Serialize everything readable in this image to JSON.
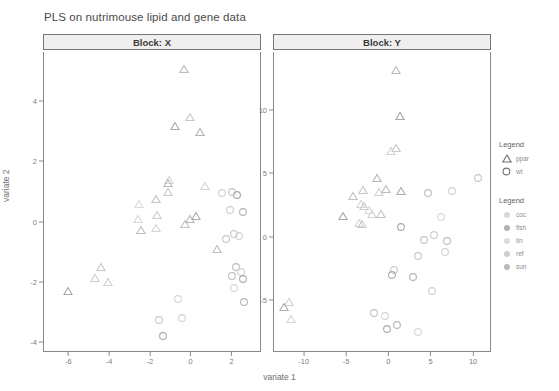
{
  "title": "PLS on nutrimouse lipid and gene data",
  "axis_labels": {
    "x": "variate 1",
    "y": "variate 2"
  },
  "legends": [
    {
      "title": "Legend",
      "name": "genotype-legend",
      "items": [
        {
          "label": "ppar",
          "shape": "triangle",
          "color": "#8d8d8d"
        },
        {
          "label": "wt",
          "shape": "circle",
          "color": "#8d8d8d"
        }
      ]
    },
    {
      "title": "Legend",
      "name": "diet-legend",
      "items": [
        {
          "label": "coc",
          "color": "#d8d8d8"
        },
        {
          "label": "fish",
          "color": "#b0b0b0"
        },
        {
          "label": "lin",
          "color": "#dcdcdc"
        },
        {
          "label": "ref",
          "color": "#cfcfcf"
        },
        {
          "label": "sun",
          "color": "#b8b8b8"
        }
      ]
    }
  ],
  "chart_data": {
    "type": "scatter",
    "title": "PLS on nutrimouse lipid and gene data",
    "xlabel": "variate 1",
    "ylabel": "variate 2",
    "grid": false,
    "legend_position": "right",
    "panels": [
      {
        "name": "Block: X",
        "xlim": [
          -7.2,
          3.4
        ],
        "ylim": [
          -4.3,
          5.6
        ],
        "xticks": [
          -6,
          -4,
          -2,
          0,
          2
        ],
        "yticks": [
          -4,
          -2,
          0,
          2,
          4
        ],
        "points": [
          {
            "x": -0.35,
            "y": 5.05,
            "group": "ppar",
            "diet": "lin",
            "color": "#b9b9b9"
          },
          {
            "x": -0.75,
            "y": 3.15,
            "group": "ppar",
            "diet": "fish",
            "color": "#a8a8a8"
          },
          {
            "x": -0.05,
            "y": 3.45,
            "group": "ppar",
            "diet": "coc",
            "color": "#c9c9c9"
          },
          {
            "x": 0.45,
            "y": 2.95,
            "group": "ppar",
            "diet": "sun",
            "color": "#b2b2b2"
          },
          {
            "x": -1.05,
            "y": 1.35,
            "group": "ppar",
            "diet": "ref",
            "color": "#d2d2d2"
          },
          {
            "x": -2.55,
            "y": 0.55,
            "group": "ppar",
            "diet": "coc",
            "color": "#dadada"
          },
          {
            "x": -2.6,
            "y": 0.05,
            "group": "ppar",
            "diet": "lin",
            "color": "#d6d6d6"
          },
          {
            "x": -1.7,
            "y": 0.7,
            "group": "ppar",
            "diet": "fish",
            "color": "#c4c4c4"
          },
          {
            "x": -1.65,
            "y": 0.2,
            "group": "ppar",
            "diet": "sun",
            "color": "#cdcdcd"
          },
          {
            "x": -1.68,
            "y": -0.25,
            "group": "ppar",
            "diet": "ref",
            "color": "#d4d4d4"
          },
          {
            "x": -0.3,
            "y": -0.1,
            "group": "ppar",
            "diet": "coc",
            "color": "#c0c0c0"
          },
          {
            "x": -0.05,
            "y": 0.05,
            "group": "ppar",
            "diet": "lin",
            "color": "#b6b6b6"
          },
          {
            "x": 0.25,
            "y": 0.15,
            "group": "ppar",
            "diet": "fish",
            "color": "#a9a9a9"
          },
          {
            "x": 1.3,
            "y": -0.95,
            "group": "ppar",
            "diet": "sun",
            "color": "#bdbdbd"
          },
          {
            "x": -4.4,
            "y": -1.55,
            "group": "ppar",
            "diet": "coc",
            "color": "#c6c6c6"
          },
          {
            "x": -4.7,
            "y": -1.9,
            "group": "ppar",
            "diet": "lin",
            "color": "#cecece"
          },
          {
            "x": -4.05,
            "y": -2.05,
            "group": "ppar",
            "diet": "ref",
            "color": "#d0d0d0"
          },
          {
            "x": -6.0,
            "y": -2.35,
            "group": "ppar",
            "diet": "fish",
            "color": "#a5a5a5"
          },
          {
            "x": 1.75,
            "y": -0.6,
            "group": "wt",
            "diet": "coc",
            "color": "#c8c8c8"
          },
          {
            "x": 2.1,
            "y": -0.45,
            "group": "wt",
            "diet": "lin",
            "color": "#cbcbcb"
          },
          {
            "x": 2.35,
            "y": -0.5,
            "group": "wt",
            "diet": "ref",
            "color": "#d3d3d3"
          },
          {
            "x": 2.55,
            "y": 0.3,
            "group": "wt",
            "diet": "sun",
            "color": "#b4b4b4"
          },
          {
            "x": 2.25,
            "y": 0.85,
            "group": "wt",
            "diet": "fish",
            "color": "#a7a7a7"
          },
          {
            "x": 2.05,
            "y": 0.95,
            "group": "wt",
            "diet": "coc",
            "color": "#c5c5c5"
          },
          {
            "x": 1.55,
            "y": 0.9,
            "group": "wt",
            "diet": "lin",
            "color": "#d1d1d1"
          },
          {
            "x": 2.2,
            "y": -1.55,
            "group": "wt",
            "diet": "sun",
            "color": "#bcbcbc"
          },
          {
            "x": 2.45,
            "y": -1.7,
            "group": "wt",
            "diet": "ref",
            "color": "#cfcfcf"
          },
          {
            "x": 2.05,
            "y": -1.85,
            "group": "wt",
            "diet": "coc",
            "color": "#c2c2c2"
          },
          {
            "x": 2.55,
            "y": -1.95,
            "group": "wt",
            "diet": "fish",
            "color": "#aaaaaa"
          },
          {
            "x": 2.1,
            "y": -2.25,
            "group": "wt",
            "diet": "lin",
            "color": "#d5d5d5"
          },
          {
            "x": 2.6,
            "y": -2.7,
            "group": "wt",
            "diet": "sun",
            "color": "#b7b7b7"
          },
          {
            "x": -0.6,
            "y": -2.6,
            "group": "wt",
            "diet": "ref",
            "color": "#d7d7d7"
          },
          {
            "x": -1.55,
            "y": -3.3,
            "group": "wt",
            "diet": "coc",
            "color": "#cacaca"
          },
          {
            "x": -0.45,
            "y": -3.25,
            "group": "wt",
            "diet": "lin",
            "color": "#d2d2d2"
          },
          {
            "x": -1.35,
            "y": -3.85,
            "group": "wt",
            "diet": "fish",
            "color": "#acacac"
          },
          {
            "x": -1.1,
            "y": 1.25,
            "group": "ppar",
            "diet": "sun",
            "color": "#bbbbbb"
          },
          {
            "x": -1.12,
            "y": 0.95,
            "group": "ppar",
            "diet": "coc",
            "color": "#c7c7c7"
          },
          {
            "x": -2.45,
            "y": -0.3,
            "group": "ppar",
            "diet": "sun",
            "color": "#bebebe"
          },
          {
            "x": 0.7,
            "y": 1.15,
            "group": "ppar",
            "diet": "ref",
            "color": "#d4d4d4"
          },
          {
            "x": 1.95,
            "y": 0.35,
            "group": "wt",
            "diet": "lin",
            "color": "#cdcdcd"
          }
        ]
      },
      {
        "name": "Block: Y",
        "xlim": [
          -13.5,
          12.0
        ],
        "ylim": [
          -9.0,
          14.5
        ],
        "xticks": [
          -10,
          -5,
          0,
          5,
          10
        ],
        "yticks": [
          -5,
          0,
          5,
          10
        ],
        "points": [
          {
            "x": 0.9,
            "y": 13.1,
            "group": "ppar",
            "diet": "lin",
            "color": "#bababa"
          },
          {
            "x": 1.35,
            "y": 9.45,
            "group": "ppar",
            "diet": "fish",
            "color": "#a8a8a8"
          },
          {
            "x": 0.9,
            "y": 6.9,
            "group": "ppar",
            "diet": "coc",
            "color": "#c8c8c8"
          },
          {
            "x": 0.3,
            "y": 6.7,
            "group": "ppar",
            "diet": "sun",
            "color": "#d0d0d0"
          },
          {
            "x": -1.3,
            "y": 4.55,
            "group": "ppar",
            "diet": "ref",
            "color": "#b4b4b4"
          },
          {
            "x": -2.95,
            "y": 3.6,
            "group": "ppar",
            "diet": "coc",
            "color": "#c6c6c6"
          },
          {
            "x": -1.05,
            "y": 3.45,
            "group": "ppar",
            "diet": "lin",
            "color": "#d3d3d3"
          },
          {
            "x": -0.25,
            "y": 3.7,
            "group": "ppar",
            "diet": "sun",
            "color": "#bcbcbc"
          },
          {
            "x": 1.55,
            "y": 3.5,
            "group": "ppar",
            "diet": "fish",
            "color": "#ababab"
          },
          {
            "x": -3.2,
            "y": 2.55,
            "group": "ppar",
            "diet": "ref",
            "color": "#d6d6d6"
          },
          {
            "x": -2.85,
            "y": 2.35,
            "group": "ppar",
            "diet": "coc",
            "color": "#cbcbcb"
          },
          {
            "x": -1.95,
            "y": 1.75,
            "group": "ppar",
            "diet": "lin",
            "color": "#d1d1d1"
          },
          {
            "x": -0.9,
            "y": 1.7,
            "group": "ppar",
            "diet": "sun",
            "color": "#c3c3c3"
          },
          {
            "x": -5.35,
            "y": 1.55,
            "group": "ppar",
            "diet": "fish",
            "color": "#a9a9a9"
          },
          {
            "x": -3.45,
            "y": 1.05,
            "group": "ppar",
            "diet": "ref",
            "color": "#d4d4d4"
          },
          {
            "x": -3.15,
            "y": 0.95,
            "group": "ppar",
            "diet": "coc",
            "color": "#c9c9c9"
          },
          {
            "x": -11.7,
            "y": -5.25,
            "group": "ppar",
            "diet": "lin",
            "color": "#cfcfcf"
          },
          {
            "x": -12.35,
            "y": -5.6,
            "group": "ppar",
            "diet": "fish",
            "color": "#aeaeae"
          },
          {
            "x": -11.45,
            "y": -6.55,
            "group": "ppar",
            "diet": "ref",
            "color": "#d5d5d5"
          },
          {
            "x": 10.6,
            "y": 4.6,
            "group": "wt",
            "diet": "coc",
            "color": "#c5c5c5"
          },
          {
            "x": 7.55,
            "y": 3.55,
            "group": "wt",
            "diet": "lin",
            "color": "#d2d2d2"
          },
          {
            "x": 4.65,
            "y": 3.35,
            "group": "wt",
            "diet": "sun",
            "color": "#bfbfbf"
          },
          {
            "x": 6.25,
            "y": 1.45,
            "group": "wt",
            "diet": "ref",
            "color": "#d7d7d7"
          },
          {
            "x": 1.55,
            "y": 0.7,
            "group": "wt",
            "diet": "fish",
            "color": "#a7a7a7"
          },
          {
            "x": 4.15,
            "y": -0.35,
            "group": "wt",
            "diet": "coc",
            "color": "#c4c4c4"
          },
          {
            "x": 5.35,
            "y": 0.05,
            "group": "wt",
            "diet": "lin",
            "color": "#cececE"
          },
          {
            "x": 6.95,
            "y": -0.4,
            "group": "wt",
            "diet": "sun",
            "color": "#bdbdbd"
          },
          {
            "x": 6.65,
            "y": -1.25,
            "group": "wt",
            "diet": "ref",
            "color": "#d3d3d3"
          },
          {
            "x": 3.45,
            "y": -1.55,
            "group": "wt",
            "diet": "coc",
            "color": "#c7c7c7"
          },
          {
            "x": 0.65,
            "y": -2.7,
            "group": "wt",
            "diet": "lin",
            "color": "#cccccc"
          },
          {
            "x": 0.45,
            "y": -3.1,
            "group": "wt",
            "diet": "fish",
            "color": "#acacac"
          },
          {
            "x": 2.95,
            "y": -3.25,
            "group": "wt",
            "diet": "sun",
            "color": "#b6b6b6"
          },
          {
            "x": 5.15,
            "y": -4.35,
            "group": "wt",
            "diet": "ref",
            "color": "#d0d0d0"
          },
          {
            "x": -1.65,
            "y": -6.1,
            "group": "wt",
            "diet": "coc",
            "color": "#c2c2c2"
          },
          {
            "x": -0.35,
            "y": -6.35,
            "group": "wt",
            "diet": "lin",
            "color": "#d4d4d4"
          },
          {
            "x": -0.2,
            "y": -7.35,
            "group": "wt",
            "diet": "fish",
            "color": "#aaaaaa"
          },
          {
            "x": 1.05,
            "y": -7.05,
            "group": "wt",
            "diet": "sun",
            "color": "#b9b9b9"
          },
          {
            "x": 3.45,
            "y": -7.6,
            "group": "wt",
            "diet": "ref",
            "color": "#d6d6d6"
          },
          {
            "x": -4.2,
            "y": 3.15,
            "group": "ppar",
            "diet": "sun",
            "color": "#c0c0c0"
          },
          {
            "x": -2.25,
            "y": 2.05,
            "group": "ppar",
            "diet": "ref",
            "color": "#d8d8d8"
          }
        ]
      }
    ]
  }
}
